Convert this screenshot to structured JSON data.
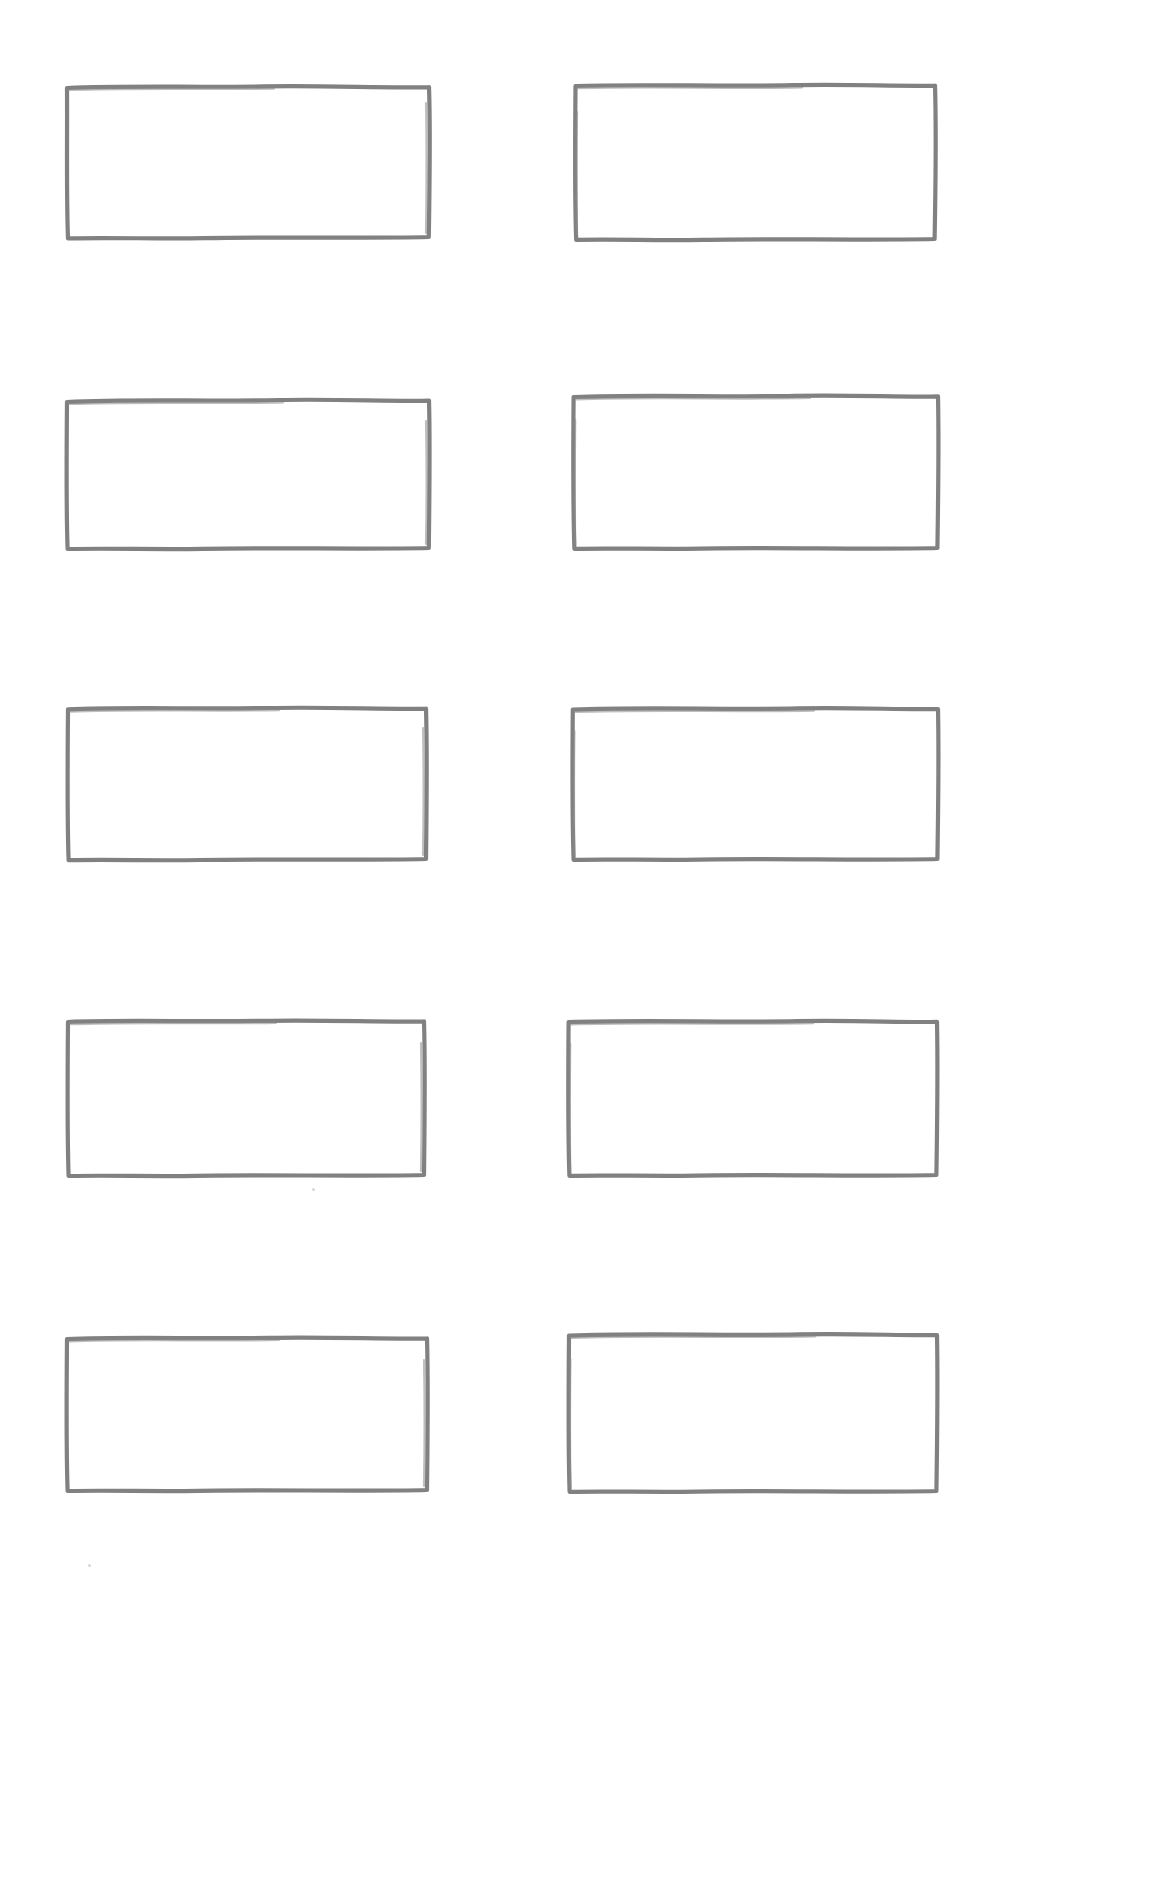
{
  "document": {
    "title": "Blank Grid Worksheet",
    "kind": "scanned-paper-sheet",
    "page_width": 1173,
    "page_height": 1897,
    "background_color": "#ffffff",
    "ink_color": "#767676",
    "stroke_style": "hand-drawn-marker",
    "columns": 2,
    "rows": 5,
    "total_boxes": 10,
    "box_content": ""
  },
  "boxes": [
    {
      "id": "box-r1-c1",
      "row": 1,
      "column": 1,
      "x": 64,
      "y": 83,
      "width": 368,
      "height": 158,
      "label": ""
    },
    {
      "id": "box-r1-c2",
      "row": 1,
      "column": 2,
      "x": 572,
      "y": 82,
      "width": 366,
      "height": 161,
      "label": ""
    },
    {
      "id": "box-r2-c1",
      "row": 2,
      "column": 1,
      "x": 63,
      "y": 396,
      "width": 370,
      "height": 156,
      "label": ""
    },
    {
      "id": "box-r2-c2",
      "row": 2,
      "column": 2,
      "x": 570,
      "y": 392,
      "width": 371,
      "height": 160,
      "label": ""
    },
    {
      "id": "box-r3-c1",
      "row": 3,
      "column": 1,
      "x": 64,
      "y": 704,
      "width": 366,
      "height": 159,
      "label": ""
    },
    {
      "id": "box-r3-c2",
      "row": 3,
      "column": 2,
      "x": 569,
      "y": 705,
      "width": 372,
      "height": 158,
      "label": ""
    },
    {
      "id": "box-r4-c1",
      "row": 4,
      "column": 1,
      "x": 64,
      "y": 1017,
      "width": 364,
      "height": 162,
      "label": ""
    },
    {
      "id": "box-r4-c2",
      "row": 4,
      "column": 2,
      "x": 565,
      "y": 1018,
      "width": 375,
      "height": 161,
      "label": ""
    },
    {
      "id": "box-r5-c1",
      "row": 5,
      "column": 1,
      "x": 63,
      "y": 1334,
      "width": 368,
      "height": 160,
      "label": ""
    },
    {
      "id": "box-r5-c2",
      "row": 5,
      "column": 2,
      "x": 565,
      "y": 1331,
      "width": 375,
      "height": 164,
      "label": ""
    }
  ],
  "specks": [
    {
      "x": 88,
      "y": 1564
    },
    {
      "x": 312,
      "y": 1188
    }
  ]
}
